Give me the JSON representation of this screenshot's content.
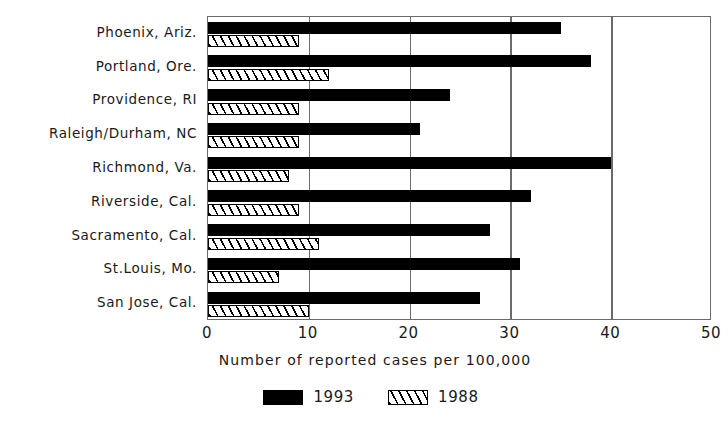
{
  "chart_data": {
    "type": "bar",
    "orientation": "horizontal",
    "title": "",
    "xlabel": "Number of reported cases per 100,000",
    "ylabel": "",
    "xlim": [
      0,
      50
    ],
    "xticks": [
      0,
      10,
      20,
      30,
      40,
      50
    ],
    "grid": "vertical",
    "legend_position": "bottom-center",
    "categories": [
      "Phoenix, Ariz.",
      "Portland, Ore.",
      "Providence, RI",
      "Raleigh/Durham, NC",
      "Richmond, Va.",
      "Riverside, Cal.",
      "Sacramento, Cal.",
      "St.Louis, Mo.",
      "San Jose, Cal."
    ],
    "series": [
      {
        "name": "1993",
        "color": "#000000",
        "pattern": "solid",
        "values": [
          35,
          38,
          24,
          21,
          40,
          32,
          28,
          31,
          27
        ]
      },
      {
        "name": "1988",
        "color": "#ffffff",
        "pattern": "diagonal-hatch",
        "values": [
          9,
          12,
          9,
          9,
          8,
          9,
          11,
          7,
          10
        ]
      }
    ]
  },
  "axis": {
    "tick_labels": [
      "0",
      "10",
      "20",
      "30",
      "40",
      "50"
    ],
    "x_axis_title": "Number of reported cases per 100,000"
  },
  "legend": {
    "items": [
      {
        "label": "1993",
        "swatch": "solid-black-swatch"
      },
      {
        "label": "1988",
        "swatch": "hatched-swatch"
      }
    ]
  }
}
